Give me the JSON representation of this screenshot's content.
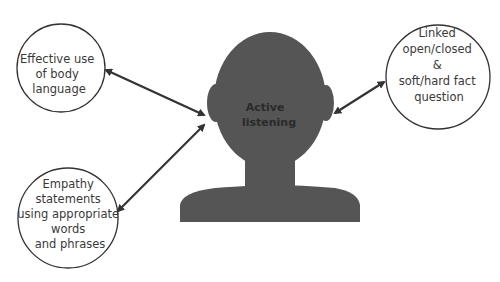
{
  "diagram": {
    "center": {
      "label_lines": [
        "Active",
        "listening"
      ]
    },
    "nodes": [
      {
        "id": "body-language",
        "lines": [
          "Effective use",
          "of body",
          "language"
        ]
      },
      {
        "id": "empathy",
        "lines": [
          "Empathy",
          "statements",
          "using appropriate",
          "words",
          "and phrases"
        ]
      },
      {
        "id": "questions",
        "lines": [
          "Linked",
          "open/closed",
          "&",
          "soft/hard fact",
          "question"
        ]
      }
    ],
    "colors": {
      "silhouette": "#555555",
      "arrow": "#333333",
      "circle_stroke": "#333333",
      "text": "#3a3a3a"
    }
  }
}
